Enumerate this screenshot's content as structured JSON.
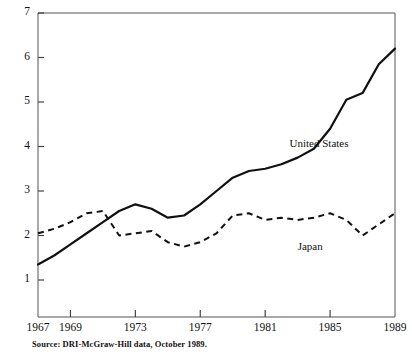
{
  "figure": {
    "clipped_title_fragment": "",
    "source_note": "Source: DRI-McGraw-Hill data, October 1989."
  },
  "axes": {
    "y_ticks": [
      "7",
      "6",
      "5",
      "4",
      "3",
      "2",
      "1"
    ],
    "x_ticks": [
      "1967",
      "1969",
      "1973",
      "1977",
      "1981",
      "1985",
      "1989"
    ]
  },
  "labels": {
    "united_states": "United States",
    "japan": "Japan"
  },
  "colors": {
    "ink": "#111111",
    "background": "#ffffff",
    "axis": "#444444"
  },
  "chart_data": {
    "type": "line",
    "title": "",
    "subtitle": "",
    "xlabel": "",
    "ylabel": "",
    "xlim": [
      1967,
      1989
    ],
    "ylim": [
      0,
      7
    ],
    "grid": false,
    "legend": "inline-annotations",
    "annotations": [
      {
        "text": "United States",
        "x": 1982.5,
        "y": 4.05
      },
      {
        "text": "Japan",
        "x": 1983.0,
        "y": 1.75
      }
    ],
    "x": [
      1967,
      1968,
      1969,
      1970,
      1971,
      1972,
      1973,
      1974,
      1975,
      1976,
      1977,
      1978,
      1979,
      1980,
      1981,
      1982,
      1983,
      1984,
      1985,
      1986,
      1987,
      1988,
      1989
    ],
    "series": [
      {
        "name": "United States",
        "style": "solid",
        "values": [
          1.35,
          1.55,
          1.8,
          2.05,
          2.3,
          2.55,
          2.7,
          2.6,
          2.4,
          2.45,
          2.7,
          3.0,
          3.3,
          3.45,
          3.5,
          3.6,
          3.75,
          3.95,
          4.4,
          5.05,
          5.2,
          5.85,
          6.2
        ]
      },
      {
        "name": "Japan",
        "style": "dashed",
        "values": [
          2.05,
          2.15,
          2.3,
          2.5,
          2.55,
          2.0,
          2.05,
          2.1,
          1.85,
          1.75,
          1.85,
          2.05,
          2.45,
          2.5,
          2.35,
          2.4,
          2.35,
          2.4,
          2.5,
          2.35,
          2.0,
          2.25,
          2.5
        ]
      }
    ]
  }
}
